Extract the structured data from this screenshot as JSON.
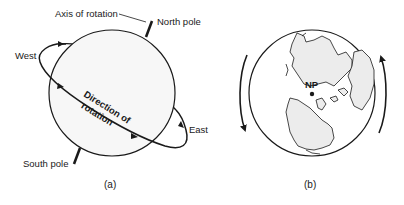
{
  "figure": {
    "panel_a": {
      "caption": "(a)",
      "labels": {
        "axis": "Axis of rotation",
        "north_pole": "North pole",
        "south_pole": "South pole",
        "west": "West",
        "east": "East",
        "direction_line1": "Direction of",
        "direction_line2": "rotation"
      }
    },
    "panel_b": {
      "caption": "(b)",
      "labels": {
        "np": "NP"
      },
      "arrows": [
        "rotation-arrow-left-downward",
        "rotation-arrow-right-upward"
      ]
    },
    "colors": {
      "stroke": "#1a1a1a",
      "globe_fill": "#f7f7f7",
      "land_fill": "#ececec"
    }
  }
}
